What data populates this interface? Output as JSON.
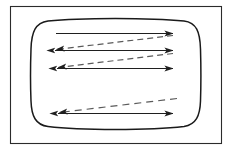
{
  "figure": {
    "title": "",
    "background_color": "#ffffff",
    "outer_frame": {
      "name": "outer-frame",
      "x": 10.5,
      "y": 6.5,
      "width": 211,
      "height": 137,
      "stroke": "#2b2b2b",
      "stroke_width": 1.1
    },
    "barrel": {
      "name": "rounded-barrel-shape",
      "stroke": "#1a1a1a",
      "stroke_width": 1.5,
      "path": "M 48 21 C 80 17.5, 150 17.5, 184 21 C 196.5 22.5, 200 32, 200.5 49 C 201 66, 201 86, 200.5 101 C 200 116, 196 124.5, 184 126.5 C 150 130.5, 80 130.5, 48 126.5 C 35.5 124.8, 31.5 116, 31 101 C 30.4 86, 30.4 66, 31 49 C 31.5 32, 35.5 22.6, 48 21 Z"
    },
    "solid_arrows": [
      {
        "name": "flow-arrow-1",
        "x1": 56,
        "y1": 33.5,
        "x2": 173,
        "y2": 33.5,
        "head_start": false,
        "head_end": true,
        "color": "#1f1f1f",
        "style": "solid"
      },
      {
        "name": "flow-arrow-2",
        "x1": 55,
        "y1": 50.5,
        "x2": 173,
        "y2": 50.5,
        "head_start": true,
        "head_end": true,
        "color": "#1f1f1f",
        "style": "solid"
      },
      {
        "name": "flow-arrow-3",
        "x1": 57,
        "y1": 68.5,
        "x2": 173,
        "y2": 68.5,
        "head_start": true,
        "head_end": true,
        "color": "#1f1f1f",
        "style": "solid"
      },
      {
        "name": "flow-arrow-4",
        "x1": 58,
        "y1": 113.5,
        "x2": 173,
        "y2": 113.5,
        "head_start": true,
        "head_end": true,
        "color": "#1f1f1f",
        "style": "solid"
      }
    ],
    "dashed_arrows": [
      {
        "name": "shear-dashed-arrow-1",
        "x1": 173,
        "y1": 35.5,
        "x2": 56,
        "y2": 49.5,
        "head_start": false,
        "head_end": true,
        "color": "#5a5a5a",
        "style": "dashed",
        "dash_pattern": "6,4"
      },
      {
        "name": "shear-dashed-arrow-2",
        "x1": 173,
        "y1": 53.5,
        "x2": 58,
        "y2": 67.5,
        "head_start": false,
        "head_end": true,
        "color": "#5a5a5a",
        "style": "dashed",
        "dash_pattern": "6,4"
      },
      {
        "name": "shear-dashed-arrow-3",
        "x1": 177,
        "y1": 98.5,
        "x2": 59,
        "y2": 112.5,
        "head_start": false,
        "head_end": true,
        "color": "#5a5a5a",
        "style": "dashed",
        "dash_pattern": "7,5"
      }
    ],
    "labels": []
  }
}
